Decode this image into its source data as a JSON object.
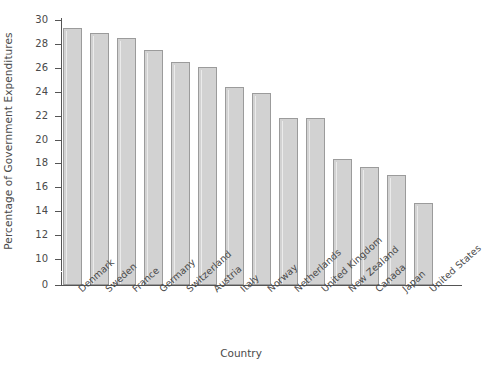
{
  "chart_data": {
    "type": "bar",
    "title": "",
    "xlabel": "Country",
    "ylabel": "Percentage of Government Expenditures",
    "categories": [
      "Denmark",
      "Sweden",
      "France",
      "Germany",
      "Switzerland",
      "Austria",
      "Italy",
      "Norway",
      "Netherlands",
      "United Kingdom",
      "New Zealand",
      "Canada",
      "Japan",
      "United States"
    ],
    "values": [
      29.3,
      28.9,
      28.5,
      27.5,
      26.5,
      26.1,
      24.4,
      23.9,
      21.8,
      21.8,
      18.4,
      17.7,
      17.0,
      14.7
    ],
    "ylim": [
      0,
      30
    ],
    "y_axis_break": true,
    "y_ticks": [
      0,
      10,
      12,
      14,
      16,
      18,
      20,
      22,
      24,
      26,
      28,
      30
    ],
    "y_tick_labels": [
      "0",
      "10",
      "12",
      "14",
      "16",
      "18",
      "20",
      "22",
      "24",
      "26",
      "28",
      "30"
    ],
    "grid": false,
    "legend": null,
    "bar_fill": "#d2d2d2",
    "bar_edge": "#9b9b9b",
    "axis_color": "#555555",
    "text_color": "#4a4a4a"
  }
}
